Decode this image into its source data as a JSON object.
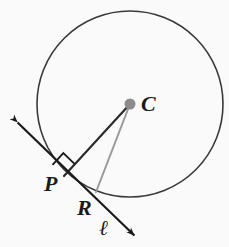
{
  "figure": {
    "background_color": "#fafafa",
    "width": 229,
    "height": 247
  },
  "colors": {
    "circle_stroke": "#3a3a3a",
    "radius_stroke": "#2b2b2b",
    "secondary_stroke": "#9a9a9a",
    "tangent_line": "#1a1a1a",
    "center_dot": "#8c8c8c",
    "label_color": "#1a1a1a",
    "right_angle_stroke": "#1a1a1a"
  },
  "labels": {
    "center": "C",
    "tangent_point": "P",
    "secondary_point": "R",
    "line": "ℓ"
  },
  "chart_data": {
    "type": "diagram",
    "circle": {
      "center": {
        "x": 130,
        "y": 104
      },
      "radius": 93,
      "stroke_width": 1.6
    },
    "points": [
      {
        "name": "C",
        "label": "C",
        "x": 130,
        "y": 104,
        "marker": "filled-dot",
        "radius": 5.5
      },
      {
        "name": "P",
        "label": "P",
        "x": 64,
        "y": 176,
        "marker": "none"
      },
      {
        "name": "R",
        "label": "R",
        "x": 96,
        "y": 192,
        "marker": "none"
      }
    ],
    "segments": [
      {
        "name": "radius-CP",
        "from": "C",
        "to": "P",
        "x1": 130,
        "y1": 104,
        "x2": 64,
        "y2": 176,
        "stroke": "#2b2b2b",
        "stroke_width": 2.2
      },
      {
        "name": "segment-CR",
        "from": "C",
        "to": "R",
        "x1": 130,
        "y1": 104,
        "x2": 96,
        "y2": 192,
        "stroke": "#9a9a9a",
        "stroke_width": 2.0
      }
    ],
    "lines": [
      {
        "name": "tangent-line-l",
        "label": "ℓ",
        "double_arrow": true,
        "x1": 14,
        "y1": 119,
        "x2": 138,
        "y2": 239,
        "stroke": "#1a1a1a",
        "stroke_width": 2.2
      }
    ],
    "angle_marks": [
      {
        "name": "right-angle-at-P",
        "vertex": "P",
        "size": 16,
        "type": "square",
        "value_degrees": 90
      }
    ],
    "annotations": [
      "Line ℓ is tangent to circle C at point P",
      "Radius CP is perpendicular to tangent ℓ",
      "Point R lies on line ℓ and on circle C"
    ]
  }
}
